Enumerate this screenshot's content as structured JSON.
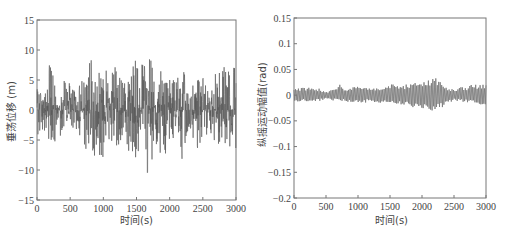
{
  "chart_data": [
    {
      "type": "line",
      "title": "",
      "xlabel": "时间(s)",
      "ylabel": "垂荡位移 (m)",
      "xlim": [
        0,
        3000
      ],
      "ylim": [
        -15,
        15
      ],
      "xticks": [
        "0",
        "500",
        "1000",
        "1500",
        "2000",
        "2500",
        "3000"
      ],
      "yticks": [
        "15",
        "10",
        "5",
        "0",
        "-5",
        "-10",
        "-15"
      ],
      "grid": false,
      "line_color": "#555555",
      "description": "Irregular heave displacement time series, random-wave response",
      "envelope": {
        "x": [
          0,
          100,
          200,
          220,
          300,
          400,
          500,
          600,
          700,
          800,
          900,
          1000,
          1100,
          1200,
          1300,
          1400,
          1500,
          1600,
          1680,
          1700,
          1800,
          1900,
          2000,
          2100,
          2200,
          2300,
          2400,
          2500,
          2600,
          2700,
          2800,
          2900,
          3000
        ],
        "max": [
          3.5,
          4.5,
          8.3,
          8.3,
          2,
          5,
          4.5,
          2.5,
          7.5,
          8.7,
          8,
          7.5,
          6.5,
          8.7,
          5,
          6,
          8.7,
          7.5,
          11,
          9.5,
          7,
          8.5,
          5,
          5,
          8.2,
          2.5,
          6,
          5.5,
          2.5,
          7.5,
          8.7,
          8.3,
          7.5
        ],
        "min": [
          -4,
          -4.5,
          -5,
          -10.2,
          -2.5,
          -6,
          -6,
          -3,
          -6.5,
          -7,
          -8,
          -9,
          -7,
          -8.3,
          -4,
          -8,
          -8.5,
          -9,
          -11,
          -9,
          -7.5,
          -8,
          -6,
          -4,
          -9.7,
          -3,
          -6.5,
          -6,
          -4,
          -6.5,
          -7,
          -6,
          -9
        ]
      }
    },
    {
      "type": "line",
      "title": "",
      "xlabel": "时间(s)",
      "ylabel": "纵摇运动幅值(rad)",
      "xlim": [
        0,
        3000
      ],
      "ylim": [
        -0.2,
        0.15
      ],
      "xticks": [
        "0",
        "500",
        "1000",
        "1500",
        "2000",
        "2500",
        "3000"
      ],
      "yticks": [
        "0.15",
        "0.1",
        "0.05",
        "0",
        "-0.05",
        "-0.1",
        "-0.15",
        "-0.2"
      ],
      "grid": false,
      "line_color": "#777777",
      "description": "Pitch motion amplitude time series, amplitude grows to peak ~0.12 rad near 2200 s",
      "envelope": {
        "x": [
          0,
          100,
          200,
          300,
          400,
          500,
          600,
          700,
          800,
          900,
          1000,
          1100,
          1200,
          1300,
          1400,
          1500,
          1600,
          1700,
          1800,
          1900,
          2000,
          2100,
          2200,
          2300,
          2400,
          2500,
          2600,
          2700,
          2800,
          2900,
          3000
        ],
        "max": [
          0.04,
          0.05,
          0.055,
          0.05,
          0.045,
          0.025,
          0.035,
          0.075,
          0.05,
          0.05,
          0.055,
          0.05,
          0.045,
          0.055,
          0.06,
          0.07,
          0.075,
          0.07,
          0.07,
          0.085,
          0.09,
          0.105,
          0.12,
          0.095,
          0.05,
          0.035,
          0.055,
          0.05,
          0.075,
          0.065,
          0.075
        ],
        "min": [
          -0.05,
          -0.045,
          -0.04,
          -0.045,
          -0.04,
          -0.03,
          -0.035,
          -0.045,
          -0.045,
          -0.045,
          -0.055,
          -0.05,
          -0.045,
          -0.05,
          -0.055,
          -0.06,
          -0.06,
          -0.065,
          -0.075,
          -0.09,
          -0.1,
          -0.105,
          -0.1,
          -0.085,
          -0.055,
          -0.04,
          -0.045,
          -0.05,
          -0.055,
          -0.06,
          -0.065
        ]
      }
    }
  ],
  "panels": {
    "left": {
      "xlabel": "时间(s)",
      "ylabel": "垂荡位移 (m)"
    },
    "right": {
      "xlabel": "时间(s)",
      "ylabel": "纵摇运动幅值(rad)"
    }
  }
}
